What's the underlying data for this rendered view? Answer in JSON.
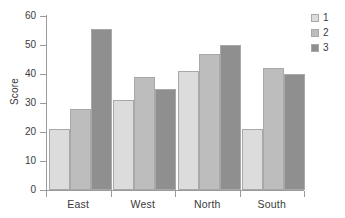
{
  "chart_data": {
    "type": "bar",
    "title": "",
    "subtitle": "",
    "xlabel": "",
    "ylabel": "Score",
    "categories": [
      "East",
      "West",
      "North",
      "South"
    ],
    "series": [
      {
        "name": "1",
        "values": [
          21,
          31,
          41,
          21
        ],
        "color": "#dcdcdc"
      },
      {
        "name": "2",
        "values": [
          28,
          39,
          47,
          42
        ],
        "color": "#bdbdbd"
      },
      {
        "name": "3",
        "values": [
          55.5,
          35,
          50,
          40
        ],
        "color": "#8f8f8f"
      }
    ],
    "ylim": [
      0,
      60
    ],
    "ytick_labels": [
      "0",
      "10",
      "20",
      "30",
      "40",
      "50",
      "60"
    ],
    "ytick_values": [
      0,
      10,
      20,
      30,
      40,
      50,
      60
    ],
    "grid": false,
    "legend_position": "top-right",
    "bar_mode": "grouped"
  },
  "legend": {
    "entries": [
      {
        "label": "1"
      },
      {
        "label": "2"
      },
      {
        "label": "3"
      }
    ]
  },
  "axes": {
    "y_title": "Score",
    "y_ticks": [
      "60",
      "50",
      "40",
      "30",
      "20",
      "10",
      "0"
    ],
    "x_ticks": [
      "East",
      "West",
      "North",
      "South"
    ]
  },
  "colors": {
    "series1": "#dcdcdc",
    "series2": "#bdbdbd",
    "series3": "#8f8f8f",
    "axis": "#9a9a9a",
    "text": "#3a3a3a",
    "background": "#ffffff"
  }
}
